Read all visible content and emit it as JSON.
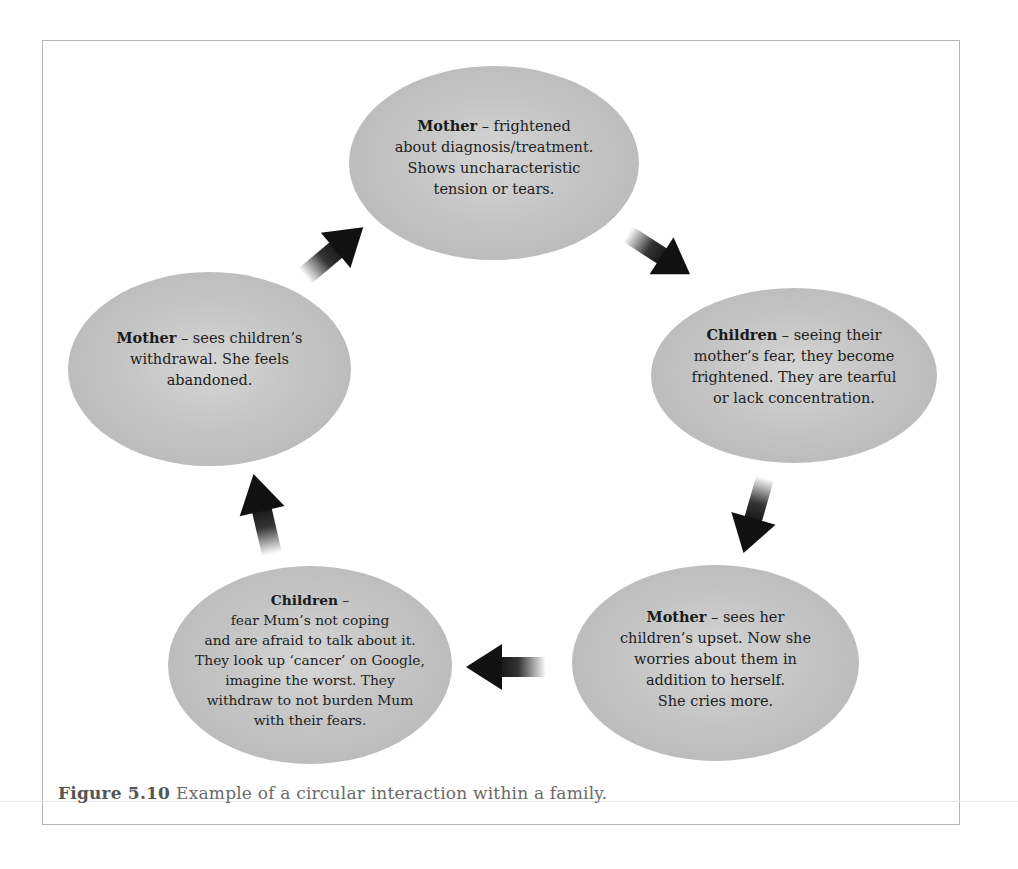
{
  "figure": {
    "type": "circular-interaction-cycle",
    "caption_label": "Figure 5.10",
    "caption_text": "Example of a circular interaction within a family.",
    "colors": {
      "node_fill_center": "#d6d6d6",
      "node_fill_edge": "#b3b3b3",
      "text": "#222222",
      "arrow": "#111111",
      "frame_border": "#b5b5b5"
    },
    "nodes": [
      {
        "id": "top",
        "subject": "Mother",
        "separator": " – ",
        "lines": [
          "frightened",
          "about diagnosis/treatment.",
          "Shows uncharacteristic",
          "tension or tears."
        ]
      },
      {
        "id": "right",
        "subject": "Children",
        "separator": " – ",
        "lines": [
          "seeing their",
          "mother’s fear, they become",
          "frightened. They are tearful",
          "or lack concentration."
        ]
      },
      {
        "id": "bottom-right",
        "subject": "Mother",
        "separator": " – ",
        "lines": [
          "sees her",
          "children’s upset. Now she",
          "worries about them in",
          "addition to herself.",
          "She cries more."
        ]
      },
      {
        "id": "bottom-left",
        "subject": "Children",
        "separator": " –",
        "lines": [
          "",
          "fear Mum’s not coping",
          "and are afraid to talk about it.",
          "They look up ‘cancer’ on Google,",
          "imagine the worst. They",
          "withdraw to not burden Mum",
          "with their fears."
        ]
      },
      {
        "id": "left",
        "subject": "Mother",
        "separator": " – ",
        "lines": [
          "sees children’s",
          "withdrawal. She feels",
          "abandoned."
        ]
      }
    ],
    "arrows": [
      {
        "from": "top",
        "to": "right",
        "direction": "down-right"
      },
      {
        "from": "right",
        "to": "bottom-right",
        "direction": "down-left"
      },
      {
        "from": "bottom-right",
        "to": "bottom-left",
        "direction": "left"
      },
      {
        "from": "bottom-left",
        "to": "left",
        "direction": "up"
      },
      {
        "from": "left",
        "to": "top",
        "direction": "up-right"
      }
    ]
  }
}
